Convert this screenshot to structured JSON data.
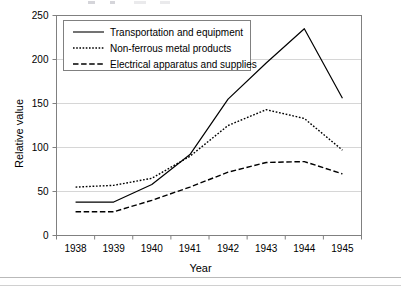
{
  "chart_data": {
    "type": "line",
    "title": "",
    "xlabel": "Year",
    "ylabel": "Relative value",
    "categories": [
      "1938",
      "1939",
      "1940",
      "1941",
      "1942",
      "1943",
      "1944",
      "1945"
    ],
    "x": [
      1938,
      1939,
      1940,
      1941,
      1942,
      1943,
      1944,
      1945
    ],
    "xlim": [
      1937.5,
      1945.5
    ],
    "ylim": [
      0,
      250
    ],
    "yticks": [
      0,
      50,
      100,
      150,
      200,
      250
    ],
    "grid": "horizontal",
    "legend_position": "top-left-inside",
    "series": [
      {
        "name": "Transportation and equipment",
        "style": "solid",
        "values": [
          38,
          38,
          58,
          92,
          155,
          196,
          235,
          156
        ]
      },
      {
        "name": "Non-ferrous metal products",
        "style": "dotted",
        "values": [
          55,
          57,
          65,
          90,
          125,
          143,
          133,
          97
        ]
      },
      {
        "name": "Electrical apparatus and supplies",
        "style": "dashed",
        "values": [
          27,
          27,
          40,
          55,
          72,
          83,
          84,
          70
        ]
      }
    ]
  },
  "axes": {
    "y_title": "Relative value",
    "x_title": "Year",
    "y_tick_labels": [
      "0",
      "50",
      "100",
      "150",
      "200",
      "250"
    ],
    "x_tick_labels": [
      "1938",
      "1939",
      "1940",
      "1941",
      "1942",
      "1943",
      "1944",
      "1945"
    ]
  },
  "legend": {
    "entries": [
      {
        "label": "Transportation and equipment",
        "style": "solid"
      },
      {
        "label": "Non-ferrous metal products",
        "style": "dotted"
      },
      {
        "label": "Electrical apparatus and supplies",
        "style": "dashed"
      }
    ]
  },
  "colors": {
    "line": "#000000",
    "grid": "#d6d6d6",
    "frame": "#808080",
    "background": "#ffffff"
  }
}
